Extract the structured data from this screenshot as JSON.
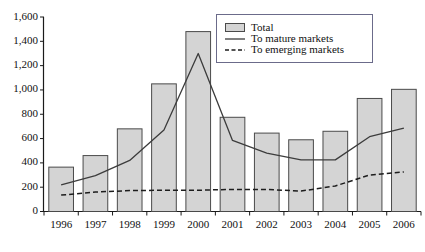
{
  "chart_data": {
    "type": "bar",
    "title": "",
    "subtitle": "",
    "xlabel": "",
    "ylabel": "",
    "categories": [
      "1996",
      "1997",
      "1998",
      "1999",
      "2000",
      "2001",
      "2002",
      "2003",
      "2004",
      "2005",
      "2006"
    ],
    "ylim": [
      0,
      1600
    ],
    "ytick_values": [
      0,
      200,
      400,
      600,
      800,
      1000,
      1200,
      1400,
      1600
    ],
    "ytick_labels": [
      "0",
      "200",
      "400",
      "600",
      "800",
      "1,000",
      "1,200",
      "1,400",
      "1,600"
    ],
    "grid": false,
    "legend_position": "top-right",
    "series": [
      {
        "name": "Total",
        "render": "bar",
        "values": [
          365,
          460,
          680,
          1050,
          1480,
          775,
          645,
          590,
          660,
          930,
          1005
        ]
      },
      {
        "name": "To mature markets",
        "render": "line-solid",
        "values": [
          220,
          295,
          420,
          670,
          1300,
          585,
          480,
          425,
          425,
          615,
          685
        ]
      },
      {
        "name": "To emerging markets",
        "render": "line-dashed",
        "values": [
          135,
          160,
          172,
          175,
          175,
          182,
          182,
          168,
          210,
          300,
          325
        ]
      }
    ]
  },
  "legend": {
    "items": [
      {
        "label": "Total",
        "marker": "filled-square-swatch"
      },
      {
        "label": "To mature markets",
        "marker": "solid-line"
      },
      {
        "label": "To emerging markets",
        "marker": "dashed-line"
      }
    ]
  },
  "colors": {
    "bar_fill": "#d4d4d4",
    "bar_stroke": "#4a4a4a",
    "axis": "#1a1a1a",
    "mature_line": "#3c3c3c",
    "emerging_line": "#1d1d1d",
    "legend_border": "#6b6b8a",
    "background": "#ffffff"
  }
}
